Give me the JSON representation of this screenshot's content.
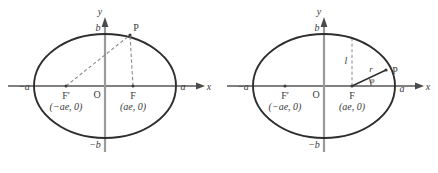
{
  "figures": [
    {
      "id": "ellipse-two-foci",
      "axes": {
        "x_label": "x",
        "y_label": "y"
      },
      "labels": {
        "vertex_right": "a",
        "vertex_left": "−a",
        "covertex_top": "b",
        "covertex_bottom": "−b",
        "origin": "O",
        "focus_right": "F",
        "focus_right_coords": "(ae, 0)",
        "focus_left": "F′",
        "focus_left_coords": "(−ae, 0)",
        "point": "P"
      },
      "geometry": {
        "center_x": 105,
        "center_y": 86,
        "semi_major": 71,
        "semi_minor": 52,
        "focus_offset": 28,
        "point_p_x": 130,
        "point_p_y": 35
      }
    },
    {
      "id": "ellipse-focal-chord",
      "axes": {
        "x_label": "x",
        "y_label": "y"
      },
      "labels": {
        "vertex_right": "a",
        "vertex_left": "−a",
        "covertex_top": "b",
        "covertex_bottom": "−b",
        "origin": "O",
        "focus_right": "F",
        "focus_right_coords": "(ae, 0)",
        "focus_left": "F′",
        "focus_left_coords": "(−ae, 0)",
        "point": "P",
        "radius": "r",
        "semi_latus_rectum": "l",
        "angle": "φ"
      },
      "geometry": {
        "center_x": 105,
        "center_y": 86,
        "semi_major": 71,
        "semi_minor": 52,
        "focus_offset": 28,
        "point_p_x": 167,
        "point_p_y": 71,
        "latus_rectum_top_y": 47
      }
    }
  ],
  "colors": {
    "curve": "#2e2e2e",
    "axis": "#808080",
    "dashed": "#8a8a8a",
    "text": "#3a3a3a"
  }
}
